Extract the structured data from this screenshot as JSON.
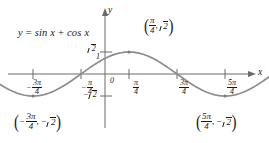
{
  "chart_data": {
    "type": "line",
    "title": "",
    "equation_label": "y = sin x + cos x",
    "function": "y = sin x + cos x",
    "amplitude": 1.4142,
    "phase_shift": 0.7854,
    "xlabel": "x",
    "ylabel": "y",
    "grid": false,
    "legend": "none",
    "xlim": [
      -4.3,
      5.7
    ],
    "ylim": [
      -2.05,
      2.15
    ],
    "x_tick_values": [
      -2.356,
      -0.785,
      0.785,
      2.356,
      3.927
    ],
    "x_tick_labels": [
      "-3pi/4",
      "-pi/4",
      "pi/4",
      "3pi/4",
      "5pi/4"
    ],
    "y_tick_values": [
      1.4142,
      1,
      -1.4142
    ],
    "y_tick_labels": [
      "sqrt2",
      "1",
      "-sqrt2"
    ],
    "origin_label": "0",
    "points": [
      {
        "x": 0.785,
        "y": 1.4142,
        "label": "(pi/4, sqrt2)"
      },
      {
        "x": -2.356,
        "y": -1.4142,
        "label": "(-3pi/4, -sqrt2)"
      },
      {
        "x": 3.927,
        "y": -1.4142,
        "label": "(5pi/4, -sqrt2)"
      }
    ],
    "series": [
      {
        "name": "y = sin x + cos x",
        "x": [
          -4.3,
          -4.0,
          -3.6,
          -3.2,
          -2.8,
          -2.356,
          -2.0,
          -1.6,
          -1.2,
          -0.785,
          -0.4,
          0.0,
          0.4,
          0.785,
          1.2,
          1.6,
          2.0,
          2.356,
          2.8,
          3.2,
          3.6,
          3.927,
          4.3,
          4.7,
          5.1,
          5.7
        ],
        "y": [
          -1.28,
          -1.41,
          -1.41,
          -1.27,
          -0.98,
          -1.41,
          -1.32,
          -1.03,
          -0.57,
          0.0,
          0.53,
          1.0,
          1.31,
          1.4142,
          1.29,
          1.0,
          0.49,
          0.0,
          -0.66,
          -1.05,
          -1.33,
          -1.4142,
          -1.35,
          -1.0,
          -0.53,
          0.19
        ]
      }
    ],
    "colors": {
      "curve": "#8c8c8c",
      "axis": "#6b6b6b",
      "text": "#1a1a1a",
      "marker": "#7a7a7a"
    }
  },
  "labels": {
    "equation": {
      "y": "y",
      "eq": "=",
      "sin": "sin",
      "x1": "x",
      "plus": "+",
      "cos": "cos",
      "x2": "x"
    },
    "axis_x": "x",
    "axis_y": "y",
    "origin": "0",
    "y_tick_one": "1",
    "y_tick_sqrt2_radicand": "2",
    "y_tick_neg_sqrt2_sign": "−",
    "y_tick_neg_sqrt2_radicand": "2",
    "x_tick_neg3pi4": {
      "sign": "−",
      "num": "3π",
      "den": "4"
    },
    "x_tick_negpi4": {
      "sign": "−",
      "num": "π",
      "den": "4"
    },
    "x_tick_pi4": {
      "num": "π",
      "den": "4"
    },
    "x_tick_3pi4": {
      "num": "3π",
      "den": "4"
    },
    "x_tick_5pi4": {
      "num": "5π",
      "den": "4"
    },
    "point_peak": {
      "open": "(",
      "num": "π",
      "den": "4",
      "comma": ",",
      "radicand": "2",
      "close": ")"
    },
    "point_trough_left": {
      "open": "(",
      "sign": "−",
      "num": "3π",
      "den": "4",
      "comma": ",",
      "neg": "−",
      "radicand": "2",
      "close": ")"
    },
    "point_trough_right": {
      "open": "(",
      "num": "5π",
      "den": "4",
      "comma": ",",
      "neg": "−",
      "radicand": "2",
      "close": ")"
    }
  }
}
